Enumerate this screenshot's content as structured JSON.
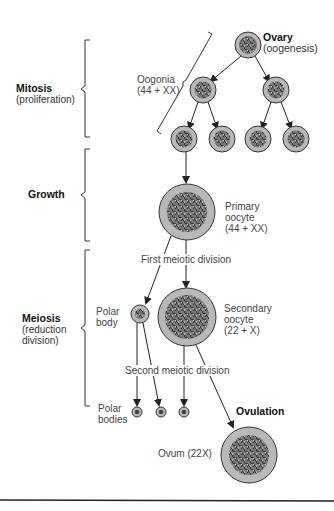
{
  "stages": {
    "mitosis": {
      "title": "Mitosis",
      "subtitle": "(proliferation)"
    },
    "growth": {
      "title": "Growth",
      "subtitle": ""
    },
    "meiosis": {
      "title": "Meiosis",
      "subtitle_line1": "(reduction",
      "subtitle_line2": "division)"
    }
  },
  "labels": {
    "ovary_title": "Ovary",
    "ovary_sub": "(oogenesis)",
    "oogonia_line1": "Oogonia",
    "oogonia_line2": "(44 + XX)",
    "primary_line1": "Primary",
    "primary_line2": "oocyte",
    "primary_line3": "(44 + XX)",
    "first_division": "First meiotic division",
    "polar_body_line1": "Polar",
    "polar_body_line2": "body",
    "secondary_line1": "Secondary",
    "secondary_line2": "oocyte",
    "secondary_line3": "(22 + X)",
    "second_division": "Second meiotic division",
    "polar_bodies_line1": "Polar",
    "polar_bodies_line2": "bodies",
    "ovulation": "Ovulation",
    "ovum": "Ovum (22X)"
  },
  "colors": {
    "cell_cytoplasm": "#b8b8b8",
    "cell_outline": "#333333",
    "nucleus": "#4a4a4a",
    "line": "#222222"
  }
}
